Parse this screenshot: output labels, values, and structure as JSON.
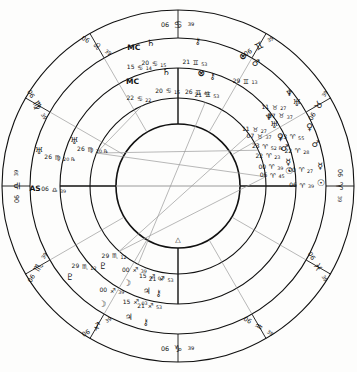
{
  "chart": {
    "type": "astrological-natal-wheel",
    "geometry": {
      "width": 357,
      "height": 372,
      "center_x": 178,
      "center_y": 186,
      "ring_outer_r": 176,
      "ring_zodiac_inner_r": 148,
      "ring_mid_r": 118,
      "ring_inner_house_r": 88,
      "inner_circle_r": 62,
      "ascendant_angle_deg": 180
    },
    "colors": {
      "line": "#111111",
      "aspect_line": "#9a9a9a",
      "background": "#fdfdfc",
      "text": "#111111"
    }
  },
  "zodiac_cusps": [
    {
      "name": "cusp-aries",
      "glyph": "♈",
      "deg": "06",
      "min": "39",
      "angle": 180
    },
    {
      "name": "cusp-taurus",
      "glyph": "♉",
      "deg": "06",
      "min": "39",
      "angle": 210
    },
    {
      "name": "cusp-gemini",
      "glyph": "♊",
      "deg": "06",
      "min": "39",
      "angle": 240
    },
    {
      "name": "cusp-cancer",
      "glyph": "♋",
      "deg": "06",
      "min": "39",
      "angle": 270
    },
    {
      "name": "cusp-leo",
      "glyph": "♌",
      "deg": "06",
      "min": "39",
      "angle": 300
    },
    {
      "name": "cusp-virgo",
      "glyph": "♍",
      "deg": "06",
      "min": "39",
      "angle": 330
    },
    {
      "name": "cusp-libra",
      "glyph": "♎",
      "deg": "06",
      "min": "39",
      "angle": 0
    },
    {
      "name": "cusp-scorpio",
      "glyph": "♏",
      "deg": "06",
      "min": "39",
      "angle": 30
    },
    {
      "name": "cusp-sagittarius",
      "glyph": "♐",
      "deg": "06",
      "min": "39",
      "angle": 60
    },
    {
      "name": "cusp-capricorn",
      "glyph": "♑",
      "deg": "06",
      "min": "39",
      "angle": 90
    },
    {
      "name": "cusp-aquarius",
      "glyph": "♒",
      "deg": "06",
      "min": "39",
      "angle": 120
    },
    {
      "name": "cusp-pisces",
      "glyph": "♓",
      "deg": "06",
      "min": "39",
      "angle": 150
    }
  ],
  "outer_planets": [
    {
      "name": "planet-sun-outer",
      "body": "Sun",
      "glyph": "☉",
      "deg": "06",
      "sign": "♈",
      "min": "39",
      "angle": 180
    },
    {
      "name": "planet-mercury-outer",
      "body": "Mercury",
      "glyph": "☿",
      "deg": "00",
      "sign": "♈",
      "min": "27",
      "angle": 187
    },
    {
      "name": "planet-mars-outer",
      "body": "Mars",
      "glyph": "♂",
      "deg": "22",
      "sign": "♈",
      "min": "28",
      "angle": 196
    },
    {
      "name": "planet-venus-outer",
      "body": "Venus",
      "glyph": "♀",
      "deg": "23",
      "sign": "♈",
      "min": "55",
      "angle": 203
    },
    {
      "name": "planet-uranus-outer",
      "body": "Uranus",
      "glyph": "♅",
      "deg": "07",
      "sign": "♉",
      "min": "37",
      "angle": 214
    },
    {
      "name": "planet-neptune-outer",
      "body": "Neptune",
      "glyph": "♆",
      "deg": "11",
      "sign": "♉",
      "min": "27",
      "angle": 219
    },
    {
      "name": "planet-marsb-outer",
      "body": "Mars",
      "glyph": "♂",
      "deg": "29",
      "sign": "♊",
      "min": "13",
      "angle": 237
    },
    {
      "name": "planet-fortune-outer",
      "body": "Part of Fortune",
      "glyph": "⊗",
      "deg": "",
      "sign": "",
      "min": "",
      "angle": 243
    },
    {
      "name": "planet-chiron-outer",
      "body": "Chiron",
      "glyph": "⚷",
      "deg": "21",
      "sign": "♊",
      "min": "53",
      "angle": 262
    },
    {
      "name": "planet-saturn-outer",
      "body": "Saturn",
      "glyph": "♄",
      "deg": "20",
      "sign": "♋",
      "min": "15",
      "angle": 281
    },
    {
      "name": "planet-mc-outer",
      "body": "Midheaven",
      "glyph": "MC",
      "deg": "15",
      "sign": "♋",
      "min": "14",
      "angle": 288
    },
    {
      "name": "planet-uranusb-outer",
      "body": "Uranus",
      "glyph": "♅",
      "deg": "26",
      "sign": "♍",
      "min": "20",
      "retro": "℞",
      "angle": 347
    },
    {
      "name": "planet-as-outer",
      "body": "Ascendant",
      "glyph": "AS",
      "deg": "06",
      "sign": "♎",
      "min": "39",
      "angle": 2
    },
    {
      "name": "planet-pluto-outer",
      "body": "Pluto",
      "glyph": "♇",
      "deg": "29",
      "sign": "♏",
      "min": "12",
      "angle": 41
    },
    {
      "name": "planet-moon-outer",
      "body": "Moon",
      "glyph": "☽",
      "deg": "00",
      "sign": "♐",
      "min": "39",
      "angle": 58
    },
    {
      "name": "planet-jupiter-outer",
      "body": "Jupiter",
      "glyph": "♃",
      "deg": "15",
      "sign": "♐",
      "min": "03",
      "angle": 70
    },
    {
      "name": "planet-chironb-outer",
      "body": "Chiron",
      "glyph": "⚷",
      "deg": "21",
      "sign": "♐",
      "min": "53",
      "angle": 77
    }
  ],
  "inner_planets": [
    {
      "name": "planet-sun-inner",
      "body": "Sun",
      "glyph": "☉",
      "deg": "06",
      "sign": "♈",
      "min": "45",
      "angle": 186
    },
    {
      "name": "planet-mercury-inner",
      "body": "Mercury",
      "glyph": "☿",
      "deg": "00",
      "sign": "♈",
      "min": "39",
      "angle": 191
    },
    {
      "name": "planet-mars-inner",
      "body": "Mars",
      "glyph": "♂",
      "deg": "22",
      "sign": "♈",
      "min": "23",
      "angle": 198
    },
    {
      "name": "planet-venus-inner",
      "body": "Venus",
      "glyph": "♀",
      "deg": "23",
      "sign": "♈",
      "min": "52",
      "retro": "℞",
      "angle": 204
    },
    {
      "name": "planet-uranus-inner",
      "body": "Uranus",
      "glyph": "♅",
      "deg": "07",
      "sign": "♉",
      "min": "37",
      "angle": 211
    },
    {
      "name": "planet-neptune-inner",
      "body": "Neptune",
      "glyph": "♆",
      "deg": "11",
      "sign": "♉",
      "min": "27",
      "angle": 216
    },
    {
      "name": "planet-chiron-inner",
      "body": "Chiron",
      "glyph": "⚷",
      "deg": "21",
      "sign": "♊",
      "min": "53",
      "angle": 252
    },
    {
      "name": "planet-fortune-inner",
      "body": "Part of Fortune",
      "glyph": "⊗",
      "deg": "26",
      "sign": "♊",
      "min": "41",
      "angle": 258
    },
    {
      "name": "planet-saturn-inner",
      "body": "Saturn",
      "glyph": "♄",
      "deg": "20",
      "sign": "♋",
      "min": "15",
      "angle": 276
    },
    {
      "name": "planet-mc-inner",
      "body": "Midheaven",
      "glyph": "MC",
      "deg": "22",
      "sign": "♋",
      "min": "22",
      "angle": 294
    },
    {
      "name": "planet-uranusb-inner",
      "body": "Uranus",
      "glyph": "♅",
      "deg": "26",
      "sign": "♍",
      "min": "20",
      "retro": "℞",
      "angle": 338
    },
    {
      "name": "planet-pluto-inner",
      "body": "Pluto",
      "glyph": "♇",
      "deg": "29",
      "sign": "♏",
      "min": "12",
      "angle": 48
    },
    {
      "name": "planet-moon-inner",
      "body": "Moon",
      "glyph": "☽",
      "deg": "00",
      "sign": "♐",
      "min": "39",
      "angle": 63
    },
    {
      "name": "planet-jupiter-inner",
      "body": "Jupiter",
      "glyph": "♃",
      "deg": "15",
      "sign": "♐",
      "min": "03",
      "angle": 74
    },
    {
      "name": "planet-chironb-inner",
      "body": "Chiron",
      "glyph": "⚷",
      "deg": "21",
      "sign": "♐",
      "min": "53",
      "angle": 80
    }
  ],
  "house_cusp_angles": [
    0,
    30,
    60,
    90,
    120,
    150,
    180,
    210,
    240,
    270,
    300,
    330
  ],
  "axis_lines": [
    {
      "name": "ascendant-descendant-axis",
      "angle": 0
    },
    {
      "name": "mc-ic-axis",
      "angle": 90
    }
  ],
  "aspect_lines": [
    {
      "name": "aspect-line-1",
      "a": 186,
      "b": 338
    },
    {
      "name": "aspect-line-2",
      "a": 204,
      "b": 338
    },
    {
      "name": "aspect-line-3",
      "a": 186,
      "b": 48
    },
    {
      "name": "aspect-line-4",
      "a": 294,
      "b": 338
    },
    {
      "name": "aspect-line-5",
      "a": 63,
      "b": 252
    },
    {
      "name": "aspect-line-6",
      "a": 48,
      "b": 216
    }
  ],
  "center_marker": {
    "name": "center-ascendant-marker",
    "glyph": "△"
  }
}
